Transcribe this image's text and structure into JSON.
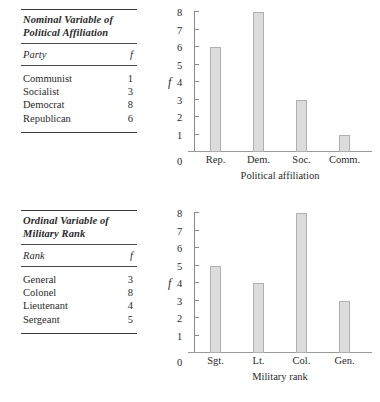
{
  "page": {
    "background": "#ffffff",
    "bar_fill": "#dcdcdc",
    "bar_stroke": "#b0b0b0",
    "axis_color": "#8a8a8a",
    "text_color": "#2b2b2b"
  },
  "panels": [
    {
      "table": {
        "title": "Nominal Variable of Political Affiliation",
        "columns": [
          "Party",
          "f"
        ],
        "rows": [
          {
            "label": "Communist",
            "value": "1"
          },
          {
            "label": "Socialist",
            "value": "3"
          },
          {
            "label": "Democrat",
            "value": "8"
          },
          {
            "label": "Republican",
            "value": "6"
          }
        ]
      },
      "chart_data": {
        "type": "bar",
        "title": "",
        "categories": [
          "Rep.",
          "Dem.",
          "Soc.",
          "Comm."
        ],
        "values": [
          6,
          8,
          3,
          1
        ],
        "xlabel": "Political affiliation",
        "ylabel": "f",
        "ylim": [
          0,
          8
        ],
        "yticks": [
          1,
          2,
          3,
          4,
          5,
          6,
          7,
          8
        ],
        "ytick_labels": [
          "1",
          "2",
          "3",
          "4",
          "5",
          "6",
          "7",
          "8"
        ],
        "origin_label": "0",
        "grid": false,
        "legend": false
      }
    },
    {
      "table": {
        "title": "Ordinal Variable of Military Rank",
        "columns": [
          "Rank",
          "f"
        ],
        "rows": [
          {
            "label": "General",
            "value": "3"
          },
          {
            "label": "Colonel",
            "value": "8"
          },
          {
            "label": "Lieutenant",
            "value": "4"
          },
          {
            "label": "Sergeant",
            "value": "5"
          }
        ]
      },
      "chart_data": {
        "type": "bar",
        "title": "",
        "categories": [
          "Sgt.",
          "Lt.",
          "Col.",
          "Gen."
        ],
        "values": [
          5,
          4,
          8,
          3
        ],
        "xlabel": "Military rank",
        "ylabel": "f",
        "ylim": [
          0,
          8
        ],
        "yticks": [
          1,
          2,
          3,
          4,
          5,
          6,
          7,
          8
        ],
        "ytick_labels": [
          "1",
          "2",
          "3",
          "4",
          "5",
          "6",
          "7",
          "8"
        ],
        "origin_label": "0",
        "grid": false,
        "legend": false
      }
    }
  ]
}
